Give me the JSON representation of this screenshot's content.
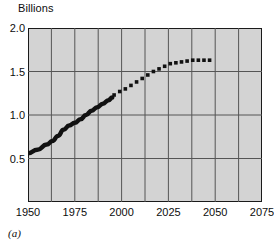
{
  "chart_data": {
    "type": "line",
    "title": "",
    "ylabel": "Billions",
    "xlabel": "",
    "caption": "(a)",
    "xlim": [
      1950,
      2075
    ],
    "ylim": [
      0.0,
      2.0
    ],
    "grid": true,
    "legend": "none",
    "x_ticks": [
      1950,
      1975,
      2000,
      2025,
      2050,
      2075
    ],
    "x_tick_labels": [
      "1950",
      "1975",
      "2000",
      "2025",
      "2050",
      "2075"
    ],
    "y_ticks": [
      0.5,
      1.0,
      1.5,
      2.0
    ],
    "y_tick_labels": [
      "0.5",
      "1.0",
      "1.5",
      "2.0"
    ],
    "x_gridlines": [
      1962.5,
      1975,
      1987.5,
      2000,
      2012.5,
      2025,
      2037.5,
      2050,
      2062.5
    ],
    "y_gridlines": [
      0.5,
      1.0,
      1.5
    ],
    "series": [
      {
        "name": "historical",
        "style": "solid",
        "color": "#111111",
        "x": [
          1950,
          1955,
          1960,
          1963,
          1966,
          1969,
          1972,
          1975,
          1978,
          1981,
          1984,
          1987,
          1990,
          1993,
          1995
        ],
        "values": [
          0.56,
          0.6,
          0.66,
          0.7,
          0.76,
          0.83,
          0.88,
          0.91,
          0.95,
          1.0,
          1.05,
          1.09,
          1.13,
          1.17,
          1.2
        ]
      },
      {
        "name": "projection",
        "style": "dotted",
        "color": "#111111",
        "x": [
          1996,
          1999,
          2002,
          2005,
          2008,
          2011,
          2014,
          2017,
          2020,
          2023,
          2026,
          2029,
          2032,
          2035,
          2038,
          2041,
          2044,
          2047
        ],
        "values": [
          1.23,
          1.27,
          1.3,
          1.34,
          1.38,
          1.42,
          1.46,
          1.5,
          1.53,
          1.56,
          1.59,
          1.6,
          1.61,
          1.62,
          1.63,
          1.63,
          1.63,
          1.63
        ]
      }
    ]
  },
  "colors": {
    "panel_fill": "#d3d3d3",
    "grid_line": "#555555",
    "frame": "#1a1a1a",
    "data": "#111111",
    "text": "#0d0d0d",
    "background": "#ffffff"
  }
}
